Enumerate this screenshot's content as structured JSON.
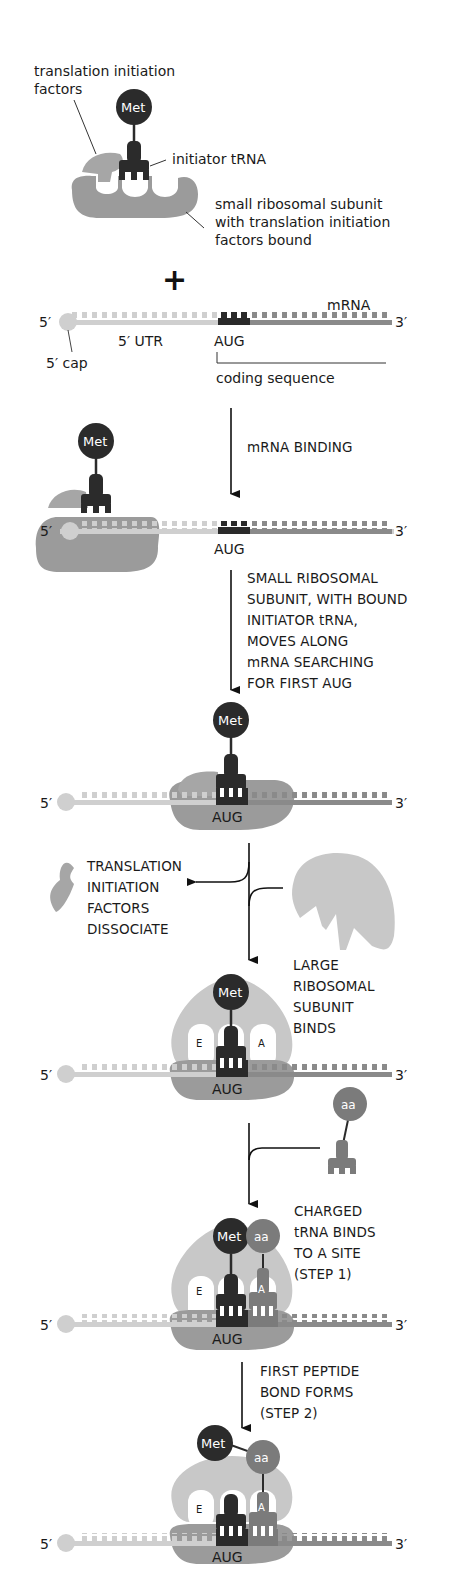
{
  "colors": {
    "ribosome_small": "#9b9b9b",
    "ribosome_large": "#c8c8c8",
    "factors": "#a6a6a6",
    "utr": "#cfcfcf",
    "coding": "#8a8a8a",
    "aug": "#2a2a2a",
    "met": "#2b2b2b",
    "aa": "#7b7b7b",
    "initiator_trna": "#2b2b2b",
    "charged_trna": "#7b7b7b",
    "arrow": "#111111"
  },
  "labels": {
    "translation_initiation_factors": "translation initiation\nfactors",
    "initiator_trna": "initiator tRNA",
    "small_subunit": "small ribosomal subunit\nwith translation initiation\nfactors bound",
    "plus": "+",
    "mrna": "mRNA",
    "five_prime": "5′",
    "three_prime": "3′",
    "five_utr": "5′ UTR",
    "five_cap": "5′ cap",
    "aug": "AUG",
    "coding_sequence": "coding sequence",
    "met": "Met",
    "aa": "aa",
    "e_site": "E",
    "a_site": "A"
  },
  "steps": [
    {
      "id": "mrna-binding",
      "text": "mRNA BINDING"
    },
    {
      "id": "scanning",
      "text": "SMALL RIBOSOMAL\nSUBUNIT, WITH BOUND\nINITIATOR tRNA,\nMOVES ALONG\nmRNA SEARCHING\nFOR FIRST AUG"
    },
    {
      "id": "factors-dissociate",
      "text": "TRANSLATION\nINITIATION\nFACTORS\nDISSOCIATE"
    },
    {
      "id": "large-subunit-binds",
      "text": "LARGE\nRIBOSOMAL\nSUBUNIT\nBINDS"
    },
    {
      "id": "charged-trna-binds",
      "text": "CHARGED\ntRNA BINDS\nTO A SITE\n(STEP 1)"
    },
    {
      "id": "peptide-bond",
      "text": "FIRST PEPTIDE\nBOND FORMS\n(STEP 2)"
    }
  ]
}
